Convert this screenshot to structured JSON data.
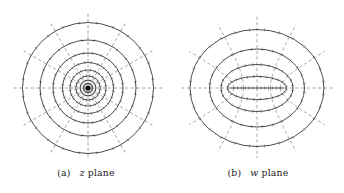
{
  "figure": {
    "kind": "conformal-mapping-diagram",
    "background_color": "#ffffff",
    "solid_curve_color": "#2b2b2b",
    "dashed_curve_color": "#8a8a8a",
    "tick_color": "#6e6e6e",
    "marker_color": "#000000",
    "caption_color": "#1a1a1a"
  },
  "panels": [
    {
      "id": "z-plane",
      "caption": {
        "tag": "(a)",
        "variable": "z",
        "word": "plane"
      },
      "geometry": {
        "description": "concentric circles and radial rays about the origin",
        "center_x": 88,
        "center_y": 82,
        "origin_marker": true,
        "origin_marker_radius": 2.6,
        "circle_count": 8,
        "circle_radii": [
          4.5,
          7.8,
          12.2,
          18.0,
          25.5,
          35.0,
          48.0,
          65.5
        ],
        "ray_count": 12,
        "ray_angles_deg": [
          0,
          30,
          60,
          90,
          120,
          150,
          180,
          210,
          240,
          270,
          300,
          330
        ],
        "ray_inner_radius": 3.0,
        "ray_outer_radius": 76.0,
        "tick_length": 3.0
      }
    },
    {
      "id": "w-plane",
      "caption": {
        "tag": "(b)",
        "variable": "w",
        "word": "plane"
      },
      "geometry": {
        "description": "confocal ellipses and confocal hyperbolas; image of the circles under the Joukowski map",
        "center_x": 85,
        "center_y": 82,
        "focus_half_distance": 27.0,
        "slit_half_length": 27.0,
        "slit_is_degenerate_ellipse": true,
        "ellipse_count": 4,
        "ellipse_semi_axes": [
          {
            "a": 29.5,
            "b": 11.5
          },
          {
            "a": 36.0,
            "b": 23.5
          },
          {
            "a": 47.5,
            "b": 39.0
          },
          {
            "a": 67.0,
            "b": 58.5
          }
        ],
        "hyperbola_count": 12,
        "hyperbola_angles_deg": [
          0,
          30,
          60,
          90,
          120,
          150,
          180,
          210,
          240,
          270,
          300,
          330
        ],
        "hyperbola_outer_radius": 78.0,
        "tick_length": 3.0
      }
    }
  ]
}
